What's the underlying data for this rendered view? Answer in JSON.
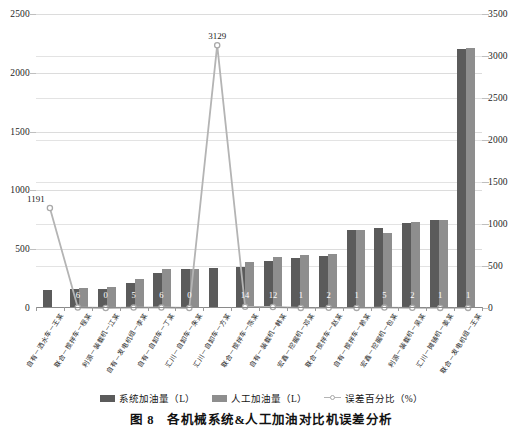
{
  "chart_data": {
    "type": "bar",
    "title": "",
    "caption": "图 8　各机械系统&人工加油对比机误差分析",
    "xlabel": "",
    "ylabel": "",
    "y_left": {
      "min": 0,
      "max": 2500,
      "ticks": [
        0,
        500,
        1000,
        1500,
        2000,
        2500
      ]
    },
    "y_right": {
      "min": 0,
      "max": 3500,
      "ticks": [
        0,
        500,
        1000,
        1500,
        2000,
        2500,
        3000,
        3500
      ]
    },
    "grid": true,
    "legend_position": "bottom",
    "categories": [
      "自有－洒水车－王某",
      "联合－搅拌车－程某",
      "利源－装载机－江某",
      "自有－发电机组－李某",
      "自有－自卸车－丁某",
      "汇川－自卸车－朱某",
      "汇川－自卸车－方某",
      "联合－搅拌车－陈某",
      "自有－装载机－韩某",
      "宏鑫－挖掘机－邓某",
      "联合－搅拌车－赵某",
      "自有－搅拌车－赖某",
      "宏鑫－挖掘机－包某",
      "利源－装载机－吴某",
      "汇川－摊铺机－姜某",
      "联合－发电机组－王某"
    ],
    "series": [
      {
        "name": "系统加油量（L）",
        "color": "#5b5b5b",
        "axis": "left",
        "values": [
          150,
          160,
          165,
          215,
          300,
          330,
          340,
          345,
          400,
          425,
          445,
          660,
          680,
          720,
          750,
          2200
        ]
      },
      {
        "name": "人工加油量（L）",
        "color": "#8e8e8e",
        "axis": "left",
        "values": [
          0,
          170,
          175,
          250,
          330,
          330,
          0,
          395,
          430,
          450,
          460,
          665,
          640,
          735,
          745,
          2215
        ]
      },
      {
        "name": "误差百分比（%）",
        "color": "#b4b4b4",
        "axis": "right",
        "values": [
          1191,
          6,
          0,
          5,
          6,
          0,
          3129,
          14,
          12,
          1,
          2,
          1,
          5,
          2,
          1,
          1
        ],
        "labels": [
          "1191",
          "6",
          "0",
          "5",
          "6",
          "0",
          "3129",
          "14",
          "12",
          "1",
          "2",
          "1",
          "5",
          "2",
          "1",
          "1"
        ]
      }
    ]
  },
  "legend": {
    "items": [
      {
        "label": "系统加油量（L）",
        "marker": "square-dark"
      },
      {
        "label": "人工加油量（L）",
        "marker": "square-gray"
      },
      {
        "label": "误差百分比（%）",
        "marker": "line-circle"
      }
    ]
  },
  "caption": {
    "text": "图 8　各机械系统&人工加油对比机误差分析"
  }
}
